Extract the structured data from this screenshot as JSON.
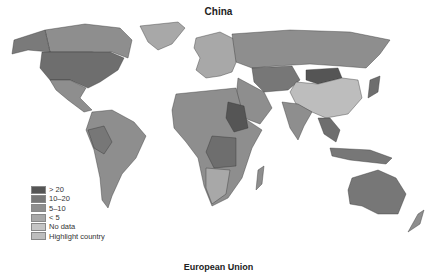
{
  "map": {
    "title": "China",
    "next_title": "European Union",
    "legend": [
      {
        "label": "> 20",
        "color": "#555555"
      },
      {
        "label": "10–20",
        "color": "#777777"
      },
      {
        "label": "5–10",
        "color": "#8e8e8e"
      },
      {
        "label": "< 5",
        "color": "#a8a8a8"
      },
      {
        "label": "No data",
        "color": "#c4c4c4"
      },
      {
        "label": "Highlight country",
        "color": "#bdbdbd"
      }
    ],
    "highlight_country": "China"
  }
}
